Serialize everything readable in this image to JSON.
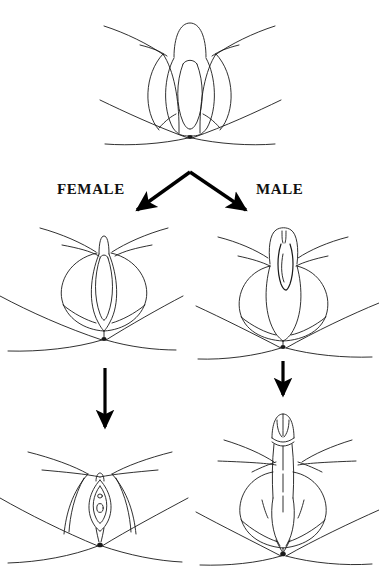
{
  "figure": {
    "background_color": "#ffffff",
    "line_color": "#1a1a1a",
    "arrow_color": "#000000",
    "width": 379,
    "height": 566
  },
  "labels": {
    "female": "FEMALE",
    "male": "MALE"
  },
  "rows": [
    {
      "name": "indifferent-stage",
      "label": "",
      "figures": [
        {
          "name": "indifferent-genitalia",
          "parts": [
            "genital-tubercle",
            "urethral-fold",
            "labioscrotal-swelling",
            "urogenital-groove",
            "anus",
            "thigh-left",
            "thigh-right"
          ]
        }
      ]
    },
    {
      "name": "differentiating-stage",
      "figures": [
        {
          "name": "female-differentiating-genitalia",
          "parts": [
            "glans-clitoris",
            "urethral-fold",
            "labioscrotal-swelling",
            "urogenital-groove",
            "anus",
            "thigh-left",
            "thigh-right"
          ]
        },
        {
          "name": "male-differentiating-genitalia",
          "parts": [
            "glans-penis",
            "urethral-groove",
            "urethral-fold",
            "labioscrotal-swelling",
            "anus",
            "thigh-left",
            "thigh-right"
          ]
        }
      ]
    },
    {
      "name": "mature-stage",
      "figures": [
        {
          "name": "female-mature-genitalia",
          "parts": [
            "clitoris",
            "labium-minus",
            "labium-majus",
            "urethral-orifice",
            "vaginal-orifice",
            "perineum",
            "anus",
            "thigh-left",
            "thigh-right"
          ]
        },
        {
          "name": "male-mature-genitalia",
          "parts": [
            "glans-penis",
            "prepuce",
            "penile-shaft",
            "penile-raphe",
            "scrotum",
            "scrotal-raphe",
            "perineum",
            "anus",
            "thigh-left",
            "thigh-right"
          ]
        }
      ]
    }
  ],
  "arrows": [
    {
      "name": "branch-arrow-to-female",
      "direction": "down-left",
      "from": [
        190,
        172
      ],
      "to": [
        133,
        214
      ]
    },
    {
      "name": "branch-arrow-to-male",
      "direction": "down-right",
      "from": [
        190,
        172
      ],
      "to": [
        250,
        214
      ]
    },
    {
      "name": "female-progression-arrow",
      "direction": "down",
      "from": [
        105,
        368
      ],
      "to": [
        105,
        433
      ]
    },
    {
      "name": "male-progression-arrow",
      "direction": "down",
      "from": [
        283,
        361
      ],
      "to": [
        283,
        401
      ]
    }
  ]
}
